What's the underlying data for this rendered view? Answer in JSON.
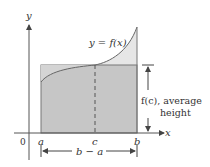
{
  "figure": {
    "axes": {
      "x_label": "x",
      "y_label": "y",
      "origin_label": "0"
    },
    "points": {
      "a_label": "a",
      "c_label": "c",
      "b_label": "b"
    },
    "curve_label": "y = f(x)",
    "height_annotation": {
      "line1": "f(c), average",
      "line2": "height"
    },
    "width_annotation": "b − a",
    "colors": {
      "rectangle_fill": "#c6c6c6",
      "area_above_fill": "#e6e6e6",
      "axis": "#555555",
      "text": "#333333",
      "border": "#777777"
    }
  }
}
